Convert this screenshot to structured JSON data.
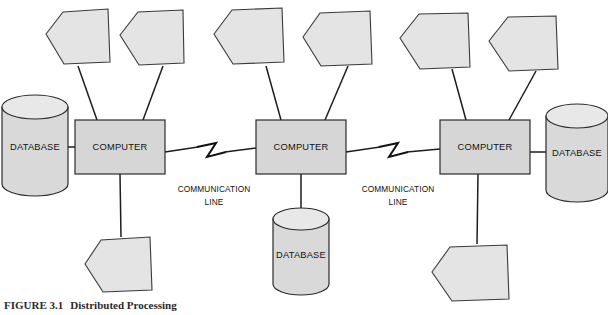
{
  "figure": {
    "number": "FIGURE 3.1",
    "title": "Distributed Processing"
  },
  "labels": {
    "computer": "COMPUTER",
    "database": "DATABASE",
    "communication_line_1": "COMMUNICATION",
    "communication_line_2": "LINE"
  },
  "colors": {
    "node_fill": "#e4e4e4",
    "box_fill": "#d6d6d6",
    "cylinder_fill": "#d9d9d9",
    "stroke": "#2b2b2b",
    "background": "#ffffff"
  },
  "nodes": {
    "computers": [
      {
        "id": "computer-left",
        "label": "COMPUTER",
        "x": 75,
        "y": 120,
        "w": 90,
        "h": 54
      },
      {
        "id": "computer-center",
        "label": "COMPUTER",
        "x": 256,
        "y": 120,
        "w": 90,
        "h": 54
      },
      {
        "id": "computer-right",
        "label": "COMPUTER",
        "x": 440,
        "y": 120,
        "w": 90,
        "h": 54
      }
    ],
    "databases": [
      {
        "id": "database-left",
        "label": "DATABASE",
        "cx": 35,
        "cy": 145,
        "rx": 33,
        "ry": 12,
        "h": 78
      },
      {
        "id": "database-center",
        "label": "DATABASE",
        "cx": 301,
        "cy": 250,
        "rx": 28,
        "ry": 11,
        "h": 68
      },
      {
        "id": "database-right",
        "label": "DATABASE",
        "cx": 577,
        "cy": 152,
        "rx": 31,
        "ry": 12,
        "h": 76
      }
    ],
    "terminals": [
      {
        "id": "terminal-1",
        "cx": 68,
        "cy": 35
      },
      {
        "id": "terminal-2",
        "cx": 160,
        "cy": 35
      },
      {
        "id": "terminal-3",
        "cx": 256,
        "cy": 35
      },
      {
        "id": "terminal-4",
        "cx": 344,
        "cy": 35
      },
      {
        "id": "terminal-5",
        "cx": 443,
        "cy": 38
      },
      {
        "id": "terminal-6",
        "cx": 533,
        "cy": 40
      },
      {
        "id": "terminal-7",
        "cx": 121,
        "cy": 265
      },
      {
        "id": "terminal-8",
        "cx": 477,
        "cy": 272
      }
    ]
  },
  "communication_links": [
    {
      "id": "comm-link-left",
      "from": "computer-left",
      "to": "computer-center",
      "label_line1": "COMMUNICATION",
      "label_line2": "LINE",
      "label_x": 214,
      "label_y": 192
    },
    {
      "id": "comm-link-right",
      "from": "computer-center",
      "to": "computer-right",
      "label_line1": "COMMUNICATION",
      "label_line2": "LINE",
      "label_x": 398,
      "label_y": 192
    }
  ]
}
